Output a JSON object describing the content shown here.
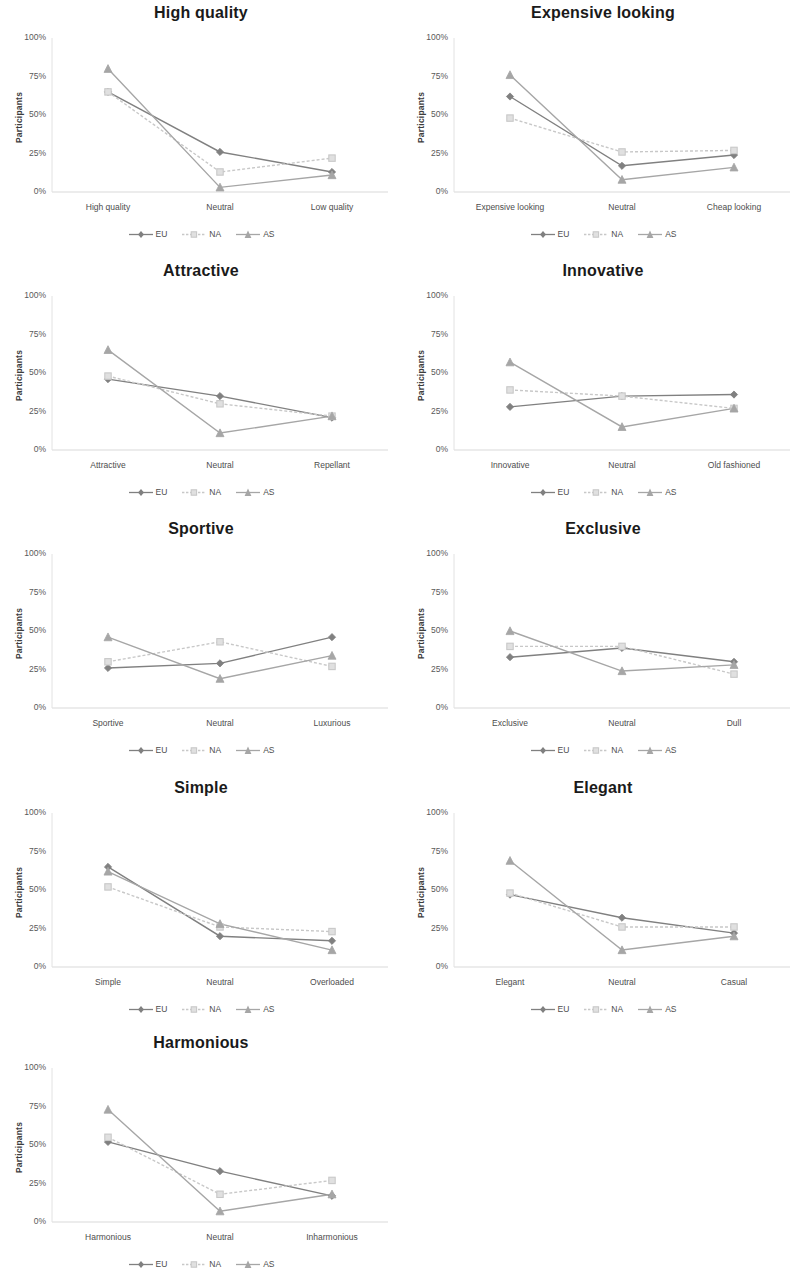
{
  "figure": {
    "series_names": [
      "EU",
      "NA",
      "AS"
    ],
    "series_colors": [
      "#808080",
      "#c8c8c8",
      "#a6a6a6"
    ],
    "series_markers": [
      "diamond",
      "square",
      "triangle"
    ],
    "y_ticks": [
      "0%",
      "25%",
      "50%",
      "75%",
      "100%"
    ],
    "y_axis_label": "Participants",
    "legend_labels": [
      "EU",
      "NA",
      "AS"
    ]
  },
  "chart_data": [
    {
      "type": "line",
      "title": "High quality",
      "xlabel": "",
      "ylabel": "Participants",
      "categories": [
        "High quality",
        "Neutral",
        "Low quality"
      ],
      "ylim": [
        0,
        100
      ],
      "ytick_values": [
        0,
        25,
        50,
        75,
        100
      ],
      "grid": false,
      "legend_position": "bottom",
      "series": [
        {
          "name": "EU",
          "values": [
            65,
            26,
            13
          ]
        },
        {
          "name": "NA",
          "values": [
            65,
            13,
            22
          ]
        },
        {
          "name": "AS",
          "values": [
            80,
            3,
            11
          ]
        }
      ]
    },
    {
      "type": "line",
      "title": "Expensive looking",
      "xlabel": "",
      "ylabel": "Participants",
      "categories": [
        "Expensive looking",
        "Neutral",
        "Cheap looking"
      ],
      "ylim": [
        0,
        100
      ],
      "ytick_values": [
        0,
        25,
        50,
        75,
        100
      ],
      "grid": false,
      "legend_position": "bottom",
      "series": [
        {
          "name": "EU",
          "values": [
            62,
            17,
            24
          ]
        },
        {
          "name": "NA",
          "values": [
            48,
            26,
            27
          ]
        },
        {
          "name": "AS",
          "values": [
            76,
            8,
            16
          ]
        }
      ]
    },
    {
      "type": "line",
      "title": "Attractive",
      "xlabel": "",
      "ylabel": "Participants",
      "categories": [
        "Attractive",
        "Neutral",
        "Repellant"
      ],
      "ylim": [
        0,
        100
      ],
      "ytick_values": [
        0,
        25,
        50,
        75,
        100
      ],
      "grid": false,
      "legend_position": "bottom",
      "series": [
        {
          "name": "EU",
          "values": [
            46,
            35,
            21
          ]
        },
        {
          "name": "NA",
          "values": [
            48,
            30,
            22
          ]
        },
        {
          "name": "AS",
          "values": [
            65,
            11,
            22
          ]
        }
      ]
    },
    {
      "type": "line",
      "title": "Innovative",
      "xlabel": "",
      "ylabel": "Participants",
      "categories": [
        "Innovative",
        "Neutral",
        "Old fashioned"
      ],
      "ylim": [
        0,
        100
      ],
      "ytick_values": [
        0,
        25,
        50,
        75,
        100
      ],
      "grid": false,
      "legend_position": "bottom",
      "series": [
        {
          "name": "EU",
          "values": [
            28,
            35,
            36
          ]
        },
        {
          "name": "NA",
          "values": [
            39,
            35,
            27
          ]
        },
        {
          "name": "AS",
          "values": [
            57,
            15,
            27
          ]
        }
      ]
    },
    {
      "type": "line",
      "title": "Sportive",
      "xlabel": "",
      "ylabel": "Participants",
      "categories": [
        "Sportive",
        "Neutral",
        "Luxurious"
      ],
      "ylim": [
        0,
        100
      ],
      "ytick_values": [
        0,
        25,
        50,
        75,
        100
      ],
      "grid": false,
      "legend_position": "bottom",
      "series": [
        {
          "name": "EU",
          "values": [
            26,
            29,
            46
          ]
        },
        {
          "name": "NA",
          "values": [
            30,
            43,
            27
          ]
        },
        {
          "name": "AS",
          "values": [
            46,
            19,
            34
          ]
        }
      ]
    },
    {
      "type": "line",
      "title": "Exclusive",
      "xlabel": "",
      "ylabel": "Participants",
      "categories": [
        "Exclusive",
        "Neutral",
        "Dull"
      ],
      "ylim": [
        0,
        100
      ],
      "ytick_values": [
        0,
        25,
        50,
        75,
        100
      ],
      "grid": false,
      "legend_position": "bottom",
      "series": [
        {
          "name": "EU",
          "values": [
            33,
            39,
            30
          ]
        },
        {
          "name": "NA",
          "values": [
            40,
            40,
            22
          ]
        },
        {
          "name": "AS",
          "values": [
            50,
            24,
            28
          ]
        }
      ]
    },
    {
      "type": "line",
      "title": "Simple",
      "xlabel": "",
      "ylabel": "Participants",
      "categories": [
        "Simple",
        "Neutral",
        "Overloaded"
      ],
      "ylim": [
        0,
        100
      ],
      "ytick_values": [
        0,
        25,
        50,
        75,
        100
      ],
      "grid": false,
      "legend_position": "bottom",
      "series": [
        {
          "name": "EU",
          "values": [
            65,
            20,
            17
          ]
        },
        {
          "name": "NA",
          "values": [
            52,
            26,
            23
          ]
        },
        {
          "name": "AS",
          "values": [
            62,
            28,
            11
          ]
        }
      ]
    },
    {
      "type": "line",
      "title": "Elegant",
      "xlabel": "",
      "ylabel": "Participants",
      "categories": [
        "Elegant",
        "Neutral",
        "Casual"
      ],
      "ylim": [
        0,
        100
      ],
      "ytick_values": [
        0,
        25,
        50,
        75,
        100
      ],
      "grid": false,
      "legend_position": "bottom",
      "series": [
        {
          "name": "EU",
          "values": [
            47,
            32,
            22
          ]
        },
        {
          "name": "NA",
          "values": [
            48,
            26,
            26
          ]
        },
        {
          "name": "AS",
          "values": [
            69,
            11,
            20
          ]
        }
      ]
    },
    {
      "type": "line",
      "title": "Harmonious",
      "xlabel": "",
      "ylabel": "Participants",
      "categories": [
        "Harmonious",
        "Neutral",
        "Inharmonious"
      ],
      "ylim": [
        0,
        100
      ],
      "ytick_values": [
        0,
        25,
        50,
        75,
        100
      ],
      "grid": false,
      "legend_position": "bottom",
      "series": [
        {
          "name": "EU",
          "values": [
            52,
            33,
            17
          ]
        },
        {
          "name": "NA",
          "values": [
            55,
            18,
            27
          ]
        },
        {
          "name": "AS",
          "values": [
            73,
            7,
            18
          ]
        }
      ]
    }
  ]
}
